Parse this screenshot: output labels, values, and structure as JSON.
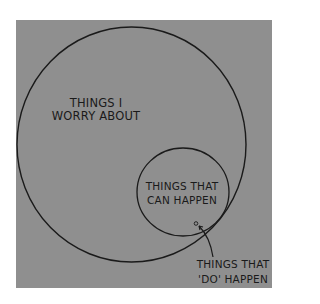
{
  "diagram": {
    "type": "venn",
    "background_color": "#8f8f8f",
    "ink_color": "#1a1a1a",
    "sets": [
      {
        "id": "worry",
        "label_lines": [
          "THINGS I",
          "WORRY ABOUT"
        ],
        "shape": "ellipse"
      },
      {
        "id": "can_happen",
        "label_lines": [
          "THINGS THAT",
          "CAN HAPPEN"
        ],
        "shape": "ellipse"
      },
      {
        "id": "do_happen",
        "label_lines": [
          "THINGS THAT",
          "'DO' HAPPEN"
        ],
        "shape": "tiny-circle",
        "annotation": "arrow"
      }
    ]
  },
  "labels": {
    "worry": {
      "line1": "THINGS I",
      "line2": "WORRY ABOUT"
    },
    "can": {
      "line1": "THINGS THAT",
      "line2": "CAN HAPPEN"
    },
    "do": {
      "line1": "THINGS THAT",
      "line2": "'DO' HAPPEN"
    }
  }
}
